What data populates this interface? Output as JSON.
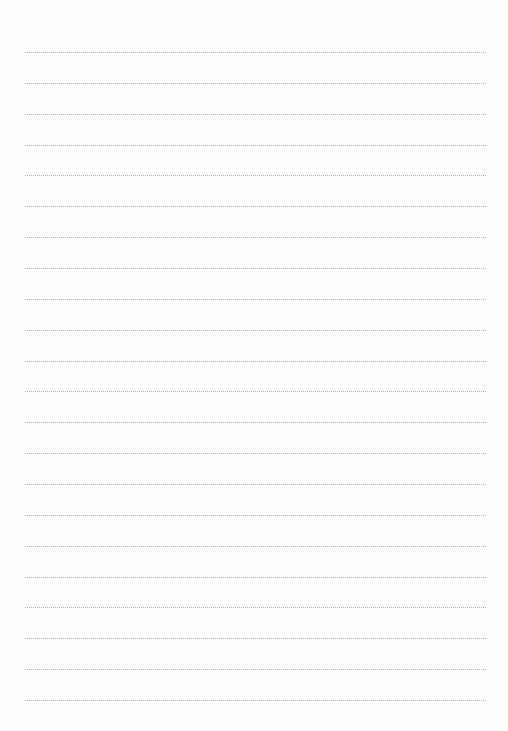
{
  "page": {
    "type": "lined-paper",
    "line_count": 22,
    "first_line_y": 52,
    "line_spacing": 30.86,
    "line_left": 25,
    "line_right": 486,
    "line_style": "dotted",
    "line_color": "#a8a8a8",
    "background_color": "#fefefe"
  }
}
